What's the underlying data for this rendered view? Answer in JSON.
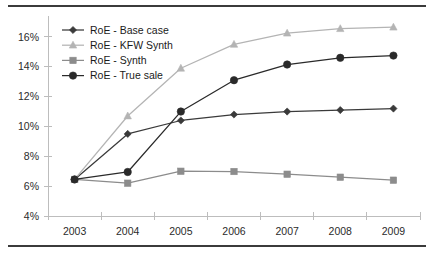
{
  "chart_data": {
    "type": "line",
    "title": "",
    "xlabel": "",
    "ylabel": "",
    "categories": [
      "2003",
      "2004",
      "2005",
      "2006",
      "2007",
      "2008",
      "2009"
    ],
    "ylim": [
      4,
      17
    ],
    "ytick_values": [
      4,
      6,
      8,
      10,
      12,
      14,
      16
    ],
    "ytick_labels": [
      "4%",
      "6%",
      "8%",
      "10%",
      "12%",
      "14%",
      "16%"
    ],
    "grid": false,
    "legend_position": "top-left",
    "series": [
      {
        "name": "RoE - Base case",
        "marker": "diamond",
        "color": "#3a3a3a",
        "values": [
          6.45,
          9.5,
          10.4,
          10.8,
          11.0,
          11.1,
          11.2
        ]
      },
      {
        "name": "RoE - KFW Synth",
        "marker": "triangle",
        "color": "#b4b4b4",
        "values": [
          6.45,
          10.7,
          13.9,
          15.5,
          16.25,
          16.55,
          16.65
        ]
      },
      {
        "name": "RoE - Synth",
        "marker": "square",
        "color": "#8c8c8c",
        "values": [
          6.45,
          6.2,
          7.0,
          6.98,
          6.8,
          6.6,
          6.4
        ]
      },
      {
        "name": "RoE - True sale",
        "marker": "circle",
        "color": "#2a2a2a",
        "values": [
          6.45,
          6.95,
          11.0,
          13.1,
          14.15,
          14.6,
          14.75
        ]
      }
    ]
  },
  "colors": {
    "rule": "#3b3b3b",
    "axis": "#bdbdbd",
    "text": "#2b2b2b",
    "background": "#ffffff"
  }
}
